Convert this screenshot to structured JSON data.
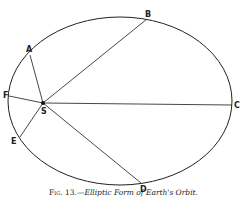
{
  "figure": {
    "caption_prefix": "Fig. 13.—",
    "caption_title": "Elliptic Form of Earth's Orbit.",
    "labels": {
      "A": "A",
      "B": "B",
      "C": "C",
      "D": "D",
      "E": "E",
      "F": "F",
      "S": "S"
    }
  }
}
